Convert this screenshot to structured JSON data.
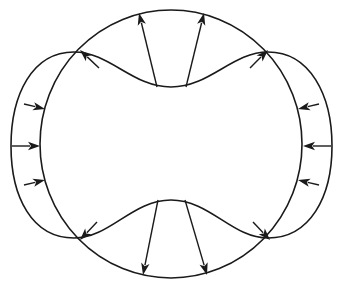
{
  "diagram": {
    "type": "deformation-field",
    "colors": {
      "stroke": "#1a1a1a",
      "background": "#ffffff"
    },
    "circle": {
      "cx": 171,
      "cy": 144,
      "rx": 131,
      "ry": 134
    },
    "peanut_path": "M171,87 C210,87 232,52 268,52 C310,52 332,95 332,146 C332,197 310,238 268,238 C232,238 210,200 171,200 C132,200 110,238 74,238 C32,238 11,197 11,146 C11,95 32,52 74,52 C110,52 132,87 171,87 Z",
    "arrows": [
      {
        "id": "top-left-vertical",
        "x1": 157,
        "y1": 87,
        "x2": 139,
        "y2": 13
      },
      {
        "id": "top-right-vertical",
        "x1": 186,
        "y1": 87,
        "x2": 204,
        "y2": 13
      },
      {
        "id": "upper-left-diagonal",
        "x1": 99,
        "y1": 68,
        "x2": 80,
        "y2": 50
      },
      {
        "id": "upper-right-diagonal",
        "x1": 250,
        "y1": 68,
        "x2": 268,
        "y2": 50
      },
      {
        "id": "left-upper",
        "x1": 24,
        "y1": 104,
        "x2": 45,
        "y2": 109
      },
      {
        "id": "left-middle",
        "x1": 12,
        "y1": 146,
        "x2": 40,
        "y2": 146
      },
      {
        "id": "left-lower",
        "x1": 24,
        "y1": 185,
        "x2": 45,
        "y2": 180
      },
      {
        "id": "right-upper",
        "x1": 319,
        "y1": 104,
        "x2": 298,
        "y2": 109
      },
      {
        "id": "right-middle",
        "x1": 331,
        "y1": 146,
        "x2": 303,
        "y2": 146
      },
      {
        "id": "right-lower",
        "x1": 319,
        "y1": 185,
        "x2": 298,
        "y2": 180
      },
      {
        "id": "lower-left-diagonal",
        "x1": 97,
        "y1": 222,
        "x2": 80,
        "y2": 240
      },
      {
        "id": "lower-right-diagonal",
        "x1": 253,
        "y1": 222,
        "x2": 270,
        "y2": 240
      },
      {
        "id": "bottom-left-vertical",
        "x1": 158,
        "y1": 200,
        "x2": 143,
        "y2": 275
      },
      {
        "id": "bottom-right-vertical",
        "x1": 185,
        "y1": 200,
        "x2": 207,
        "y2": 275
      }
    ]
  }
}
